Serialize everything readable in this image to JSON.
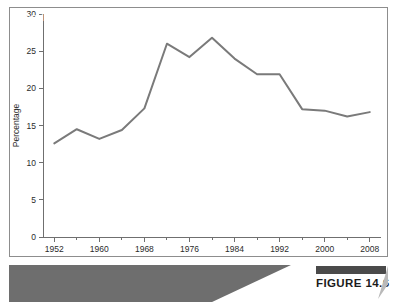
{
  "figure": {
    "caption": "Trend in Split-Ticket Voting, 1952–2008",
    "badge_label": "FIGURE 14.6",
    "border_color": "#8d8d8d",
    "banner_color": "#6e6e6e",
    "badge_bar_color": "#4a4a4a"
  },
  "chart_data": {
    "type": "line",
    "title": "",
    "xlabel": "",
    "ylabel": "Percentage",
    "xlim": [
      1950,
      2010
    ],
    "ylim": [
      0,
      30
    ],
    "grid": false,
    "legend": "none",
    "line_color": "#7a7a7a",
    "axis_color": "#6f6f6f",
    "y_ticks": [
      0,
      5,
      10,
      15,
      20,
      25,
      30
    ],
    "y_tick_labels": [
      "0",
      "5",
      "10",
      "15",
      "20",
      "25",
      "30"
    ],
    "x_ticks": [
      1952,
      1960,
      1968,
      1976,
      1984,
      1992,
      2000,
      2008
    ],
    "x_tick_labels": [
      "1952",
      "1960",
      "1968",
      "1976",
      "1984",
      "1992",
      "2000",
      "2008"
    ],
    "x_minor_ticks": [
      1956,
      1964,
      1972,
      1980,
      1988,
      1996,
      2004
    ],
    "x": [
      1952,
      1956,
      1960,
      1964,
      1968,
      1972,
      1976,
      1980,
      1984,
      1988,
      1992,
      1996,
      2000,
      2004,
      2008
    ],
    "values": [
      12.6,
      14.5,
      13.2,
      14.4,
      17.3,
      26.0,
      24.2,
      26.8,
      24.0,
      21.9,
      21.9,
      17.2,
      17.0,
      16.2,
      16.8
    ],
    "series": [
      {
        "name": "Split-ticket voting",
        "values": [
          12.6,
          14.5,
          13.2,
          14.4,
          17.3,
          26.0,
          24.2,
          26.8,
          24.0,
          21.9,
          21.9,
          17.2,
          17.0,
          16.2,
          16.8
        ]
      }
    ]
  }
}
